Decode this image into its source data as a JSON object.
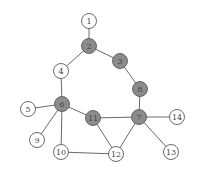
{
  "graph": {
    "node_radius": 7.5,
    "colors": {
      "shaded_fill": "#8c8c8c",
      "plain_fill": "#ffffff",
      "stroke": "#5a5a5a",
      "edge": "#6a6a6a",
      "label": "#444444"
    },
    "nodes": [
      {
        "id": "1",
        "label": "1",
        "x": 89,
        "y": 21,
        "shaded": false
      },
      {
        "id": "2",
        "label": "2",
        "x": 89,
        "y": 46,
        "shaded": true
      },
      {
        "id": "3",
        "label": "3",
        "x": 120,
        "y": 61,
        "shaded": true
      },
      {
        "id": "4",
        "label": "4",
        "x": 61,
        "y": 71,
        "shaded": false
      },
      {
        "id": "5",
        "label": "5",
        "x": 28,
        "y": 109,
        "shaded": false
      },
      {
        "id": "6",
        "label": "6",
        "x": 62,
        "y": 104,
        "shaded": true
      },
      {
        "id": "7",
        "label": "7",
        "x": 139,
        "y": 117,
        "shaded": true
      },
      {
        "id": "8",
        "label": "8",
        "x": 140,
        "y": 89,
        "shaded": true
      },
      {
        "id": "9",
        "label": "9",
        "x": 37,
        "y": 140,
        "shaded": false
      },
      {
        "id": "10",
        "label": "10",
        "x": 61,
        "y": 152,
        "shaded": false
      },
      {
        "id": "11",
        "label": "11",
        "x": 93,
        "y": 118,
        "shaded": true
      },
      {
        "id": "12",
        "label": "12",
        "x": 116,
        "y": 154,
        "shaded": false
      },
      {
        "id": "13",
        "label": "13",
        "x": 171,
        "y": 152,
        "shaded": false
      },
      {
        "id": "14",
        "label": "14",
        "x": 177,
        "y": 117,
        "shaded": false
      }
    ],
    "edges": [
      [
        "1",
        "2"
      ],
      [
        "2",
        "4"
      ],
      [
        "2",
        "3"
      ],
      [
        "3",
        "8"
      ],
      [
        "8",
        "7"
      ],
      [
        "4",
        "6"
      ],
      [
        "5",
        "6"
      ],
      [
        "6",
        "9"
      ],
      [
        "6",
        "10"
      ],
      [
        "6",
        "11"
      ],
      [
        "11",
        "7"
      ],
      [
        "11",
        "12"
      ],
      [
        "7",
        "12"
      ],
      [
        "7",
        "14"
      ],
      [
        "7",
        "13"
      ],
      [
        "10",
        "12"
      ]
    ]
  }
}
